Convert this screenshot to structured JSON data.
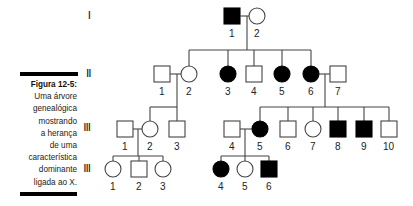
{
  "figure": {
    "title": "Figura 12-5:",
    "caption_lines": [
      "Uma árvore",
      "genealógica",
      "mostrando",
      "a herança",
      "de uma",
      "característica",
      "dominante",
      "ligada ao X."
    ]
  },
  "generations": [
    {
      "label": "I"
    },
    {
      "label": "II"
    },
    {
      "label": "III"
    },
    {
      "label": "III"
    }
  ],
  "legend": {
    "affected_fill": "#000000",
    "unaffected_fill": "#ffffff",
    "male_shape": "square",
    "female_shape": "circle"
  },
  "individuals": {
    "gen1": [
      {
        "id": "1",
        "sex": "male",
        "affected": true
      },
      {
        "id": "2",
        "sex": "female",
        "affected": false
      }
    ],
    "gen2": [
      {
        "id": "1",
        "sex": "male",
        "affected": false
      },
      {
        "id": "2",
        "sex": "female",
        "affected": false
      },
      {
        "id": "3",
        "sex": "female",
        "affected": true
      },
      {
        "id": "4",
        "sex": "male",
        "affected": false
      },
      {
        "id": "5",
        "sex": "female",
        "affected": true
      },
      {
        "id": "6",
        "sex": "female",
        "affected": true
      },
      {
        "id": "7",
        "sex": "male",
        "affected": false
      }
    ],
    "gen3": [
      {
        "id": "1",
        "sex": "male",
        "affected": false
      },
      {
        "id": "2",
        "sex": "female",
        "affected": false
      },
      {
        "id": "3",
        "sex": "male",
        "affected": false
      },
      {
        "id": "4",
        "sex": "male",
        "affected": false
      },
      {
        "id": "5",
        "sex": "female",
        "affected": true
      },
      {
        "id": "6",
        "sex": "male",
        "affected": false
      },
      {
        "id": "7",
        "sex": "female",
        "affected": false
      },
      {
        "id": "8",
        "sex": "male",
        "affected": true
      },
      {
        "id": "9",
        "sex": "male",
        "affected": true
      },
      {
        "id": "10",
        "sex": "male",
        "affected": false
      }
    ],
    "gen4": [
      {
        "id": "1",
        "sex": "female",
        "affected": false
      },
      {
        "id": "2",
        "sex": "male",
        "affected": false
      },
      {
        "id": "3",
        "sex": "female",
        "affected": false
      },
      {
        "id": "4",
        "sex": "female",
        "affected": true
      },
      {
        "id": "5",
        "sex": "female",
        "affected": false
      },
      {
        "id": "6",
        "sex": "male",
        "affected": true
      }
    ]
  }
}
